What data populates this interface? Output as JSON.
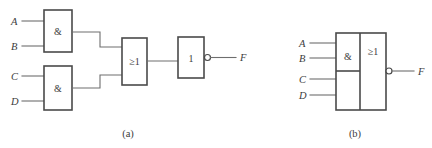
{
  "figure": {
    "background_color": "#ffffff",
    "line_color": "#6e6e6e",
    "outline_color": "#4a4a4a",
    "text_color": "#3c3c3c"
  },
  "panel_a": {
    "caption": "(a)",
    "inputs": [
      {
        "label": "A"
      },
      {
        "label": "B"
      },
      {
        "label": "C"
      },
      {
        "label": "D"
      }
    ],
    "gates": [
      {
        "symbol": "&",
        "kind": "and-gate"
      },
      {
        "symbol": "&",
        "kind": "and-gate"
      },
      {
        "symbol": "≥1",
        "kind": "or-gate"
      },
      {
        "symbol": "1",
        "kind": "not-gate"
      }
    ],
    "output": {
      "label": "F",
      "inverted": true
    }
  },
  "panel_b": {
    "caption": "(b)",
    "inputs": [
      {
        "label": "A"
      },
      {
        "label": "B"
      },
      {
        "label": "C"
      },
      {
        "label": "D"
      }
    ],
    "gates": [
      {
        "symbol": "&",
        "kind": "and-gate-array"
      },
      {
        "symbol": "≥1",
        "kind": "or-gate"
      }
    ],
    "output": {
      "label": "F",
      "inverted": true
    }
  }
}
